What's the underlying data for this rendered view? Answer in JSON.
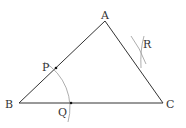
{
  "diagram": {
    "vertices": {
      "A": {
        "label": "A",
        "x": 105,
        "y": 21
      },
      "B": {
        "label": "B",
        "x": 19,
        "y": 103
      },
      "C": {
        "label": "C",
        "x": 163,
        "y": 103
      }
    },
    "points": {
      "P": {
        "label": "P",
        "x": 56,
        "y": 68
      },
      "Q": {
        "label": "Q",
        "x": 71,
        "y": 103
      },
      "R": {
        "label": "R"
      }
    },
    "colors": {
      "edge": "#333333",
      "arc": "#999999",
      "point": "#111111"
    }
  }
}
